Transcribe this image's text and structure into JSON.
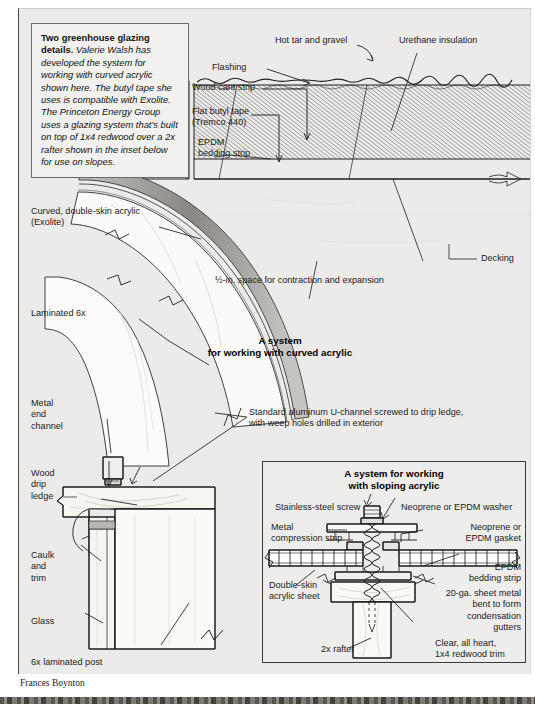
{
  "figure": {
    "credit": "Frances Boynton",
    "caption": {
      "lead": "Two greenhouse glazing details.",
      "body": " Valerie Walsh has developed the system for working with curved acrylic shown here. The butyl tape she uses is compatible with Exolite. The Princeton Energy Group uses a glazing system that's built on top of 1x4 redwood over a 2x rafter shown in the inset below for use on slopes."
    }
  },
  "main_detail": {
    "title": "A system\nfor working with curved acrylic",
    "labels": {
      "hot_tar": "Hot tar and gravel",
      "urethane": "Urethane insulation",
      "flashing": "Flashing",
      "cant_strip": "Wood cant strip",
      "butyl_tape": "Flat butyl tape\n(Tremco 440)",
      "epdm_bedding": "EPDM\nbedding strip",
      "curved_acrylic": "Curved, double-skin acrylic\n(Exolite)",
      "laminated_6x": "Laminated 6x",
      "metal_end_channel": "Metal\nend\nchannel",
      "wood_drip_ledge": "Wood\ndrip\nledge",
      "caulk_trim": "Caulk\nand\ntrim",
      "glass": "Glass",
      "post": "6x laminated post",
      "decking": "Decking",
      "expansion": "½-in. space for contraction and expansion",
      "u_channel": "Standard aluminum U-channel screwed to drip ledge,\nwith weep holes drilled in exterior"
    }
  },
  "inset_detail": {
    "title": "A system for working\nwith sloping acrylic",
    "labels": {
      "screw": "Stainless-steel screw",
      "washer": "Neoprene or EPDM washer",
      "compression_strip": "Metal\ncompression strip",
      "gasket": "Neoprene or\nEPDM gasket",
      "double_skin": "Double-skin\nacrylic sheet",
      "epdm_bedding": "EPDM\nbedding strip",
      "sheet_metal": "20-ga. sheet metal\nbent to form\ncondensation\ngutters",
      "redwood_trim": "Clear, all heart,\n1x4 redwood trim",
      "rafter": "2x rafter"
    }
  },
  "colors": {
    "panel_bg": "#ecebe9",
    "ink": "#1a1a1a",
    "acrylic_gray": "#9e9c99",
    "wood_tan": "#f4f2ec"
  }
}
